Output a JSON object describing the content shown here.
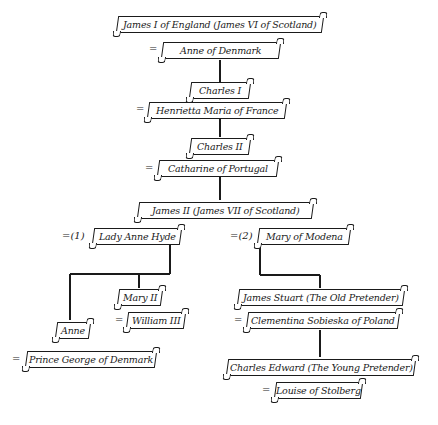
{
  "diagram": {
    "type": "family-tree",
    "title": "",
    "people": {
      "james1": "James I of England (James VI of Scotland)",
      "anne_denmark": "Anne of Denmark",
      "charles1": "Charles I",
      "henrietta": "Henrietta Maria of France",
      "charles2": "Charles II",
      "catharine": "Catharine of Portugal",
      "james2": "James II (James VII of Scotland)",
      "anne_hyde": "Lady Anne Hyde",
      "mary_modena": "Mary of Modena",
      "mary2": "Mary II",
      "william3": "William III",
      "anne": "Anne",
      "george": "Prince George of Denmark",
      "james_stuart": "James Stuart (The Old Pretender)",
      "clementina": "Clementina Sobieska of Poland",
      "charles_edward": "Charles Edward (The Young Pretender)",
      "louise": "Louise of Stolberg"
    },
    "marks": {
      "married": "=",
      "married_first": "=(1)",
      "married_second": "=(2)"
    }
  }
}
